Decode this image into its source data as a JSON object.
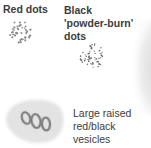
{
  "labels": {
    "red_dots": "Red dots",
    "black_dots_line1": "Black",
    "black_dots_line2": "'powder-burn'",
    "black_dots_line3": "dots",
    "vesicles_line1": "Large raised",
    "vesicles_line2": "red/black",
    "vesicles_line3": "vesicles"
  },
  "colors": {
    "text": "#3c3c3c",
    "dots": "#8a8a8a",
    "skin_patch": "#e2e2e2",
    "vesicle_ring": "#7c7c7c"
  }
}
